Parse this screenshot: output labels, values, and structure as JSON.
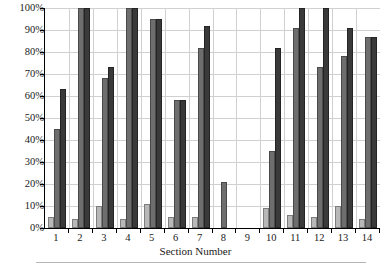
{
  "chart_data": {
    "type": "bar",
    "title": "",
    "subtitle": "",
    "xlabel": "Section Number",
    "ylabel": "",
    "ylim": [
      0,
      100
    ],
    "yunit": "%",
    "grid": true,
    "legend": "none",
    "categories": [
      "1",
      "2",
      "3",
      "4",
      "5",
      "6",
      "7",
      "8",
      "9",
      "10",
      "11",
      "12",
      "13",
      "14"
    ],
    "ytick_labels": [
      "0%",
      "10%",
      "20%",
      "30%",
      "40%",
      "50%",
      "60%",
      "70%",
      "80%",
      "90%",
      "100%"
    ],
    "ytick_values": [
      0,
      10,
      20,
      30,
      40,
      50,
      60,
      70,
      80,
      90,
      100
    ],
    "series": [
      {
        "name": "series-1-light",
        "color": "#b8b8b8",
        "values": [
          5,
          4,
          10,
          4,
          11,
          5,
          5,
          null,
          null,
          9,
          6,
          5,
          10,
          4
        ]
      },
      {
        "name": "series-2-medium",
        "color": "#6e6e6e",
        "values": [
          45,
          100,
          68,
          100,
          95,
          58,
          82,
          21,
          null,
          35,
          91,
          73,
          78,
          87
        ]
      },
      {
        "name": "series-3-dark",
        "color": "#3a3a3a",
        "values": [
          63,
          100,
          73,
          100,
          95,
          58,
          92,
          null,
          null,
          82,
          100,
          100,
          91,
          87
        ]
      }
    ]
  },
  "axis": {
    "x_title": "Section Number"
  }
}
